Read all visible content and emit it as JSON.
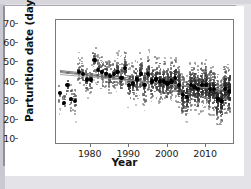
{
  "figure": {
    "background": "#ffffff",
    "outer_background": "#e3e3e8"
  },
  "axes": {
    "ylabel": "Parturition date (days)",
    "xlabel": "Year",
    "yticks": [
      10,
      20,
      30,
      40,
      50,
      60,
      70
    ],
    "xticks": [
      1980,
      1990,
      2000,
      2010
    ],
    "ylim": [
      8,
      72
    ],
    "xlim": [
      1971,
      2017
    ],
    "frame_color": "#7a7a7a",
    "tick_color": "#6e6e6e"
  },
  "chart_data": {
    "type": "scatter",
    "title": "",
    "xlabel": "Year",
    "ylabel": "Parturition date (days)",
    "xlim": [
      1971,
      2017
    ],
    "ylim": [
      8,
      72
    ],
    "grid": false,
    "legend": "none",
    "series": [
      {
        "name": "Annual mean parturition date",
        "marker": "filled-circle",
        "color": "#000000",
        "x": [
          1972,
          1973,
          1974,
          1975,
          1976,
          1977,
          1978,
          1979,
          1980,
          1981,
          1982,
          1983,
          1984,
          1985,
          1986,
          1987,
          1988,
          1989,
          1990,
          1991,
          1992,
          1993,
          1994,
          1995,
          1996,
          1997,
          1998,
          1999,
          2000,
          2001,
          2002,
          2003,
          2004,
          2005,
          2006,
          2007,
          2008,
          2009,
          2010,
          2011,
          2012,
          2013,
          2014,
          2015,
          2016
        ],
        "values": [
          34,
          29,
          38,
          31,
          30,
          45,
          44,
          41,
          41,
          51,
          46,
          45,
          44,
          43,
          44,
          45,
          42,
          47,
          38,
          39,
          41,
          44,
          38,
          44,
          40,
          41,
          40,
          40,
          39,
          40,
          42,
          38,
          33,
          32,
          38,
          37,
          36,
          38,
          38,
          36,
          36,
          31,
          30,
          36,
          35
        ]
      },
      {
        "name": "Individual observations",
        "marker": "small-circle",
        "color": "#8a8a8a",
        "description": "dense grey cloud of individual parturition dates, spanning roughly 15-70 days, becoming denser and lower after 1990"
      }
    ],
    "trend_lines": [
      {
        "name": "fitted trend 1",
        "x": [
          1972,
          2016
        ],
        "y": [
          45.5,
          35.0
        ],
        "color": "#555555"
      },
      {
        "name": "fitted trend 2",
        "x": [
          1972,
          2016
        ],
        "y": [
          44.8,
          35.6
        ],
        "color": "#777777"
      },
      {
        "name": "fitted trend 3",
        "x": [
          1972,
          2016
        ],
        "y": [
          44.0,
          36.2
        ],
        "color": "#999999"
      },
      {
        "name": "fitted trend 4",
        "x": [
          1972,
          1990
        ],
        "y": [
          45.9,
          42.0
        ],
        "color": "#666666"
      }
    ]
  }
}
